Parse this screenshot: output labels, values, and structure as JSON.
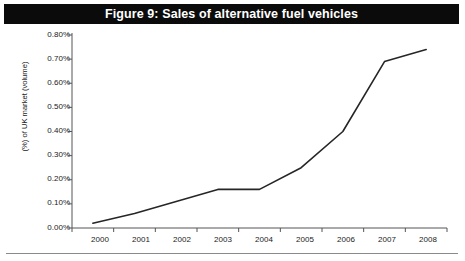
{
  "figure": {
    "title": "Figure 9: Sales of alternative fuel vehicles",
    "title_bar_color": "#0b0b0b",
    "title_text_color": "#ffffff",
    "background_color": "#ffffff"
  },
  "chart_data": {
    "type": "line",
    "title": "Figure 9: Sales of alternative fuel vehicles",
    "xlabel": "",
    "ylabel": "(%) of UK market (volume)",
    "categories": [
      "2000",
      "2001",
      "2002",
      "2003",
      "2004",
      "2005",
      "2006",
      "2007",
      "2008"
    ],
    "x": [
      2000,
      2001,
      2002,
      2003,
      2004,
      2005,
      2006,
      2007,
      2008
    ],
    "values": [
      0.02,
      0.06,
      0.11,
      0.16,
      0.16,
      0.25,
      0.4,
      0.69,
      0.74
    ],
    "series": [
      {
        "name": "Sales of alternative fuel vehicles",
        "values": [
          0.02,
          0.06,
          0.11,
          0.16,
          0.16,
          0.25,
          0.4,
          0.69,
          0.74
        ],
        "color": "#262626"
      }
    ],
    "ylim": [
      0.0,
      0.8
    ],
    "ytick_values": [
      0.0,
      0.1,
      0.2,
      0.3,
      0.4,
      0.5,
      0.6,
      0.7,
      0.8
    ],
    "ytick_labels": [
      "0.00%",
      "0.10%",
      "0.20%",
      "0.30%",
      "0.40%",
      "0.50%",
      "0.60%",
      "0.70%",
      "0.80%"
    ],
    "xtick_labels": [
      "2000",
      "2001",
      "2002",
      "2003",
      "2004",
      "2005",
      "2006",
      "2007",
      "2008"
    ],
    "grid": false,
    "legend": false,
    "legend_position": "none",
    "line_color": "#262626",
    "line_width": 1.6,
    "axis_color": "#555555",
    "value_unit": "%"
  }
}
